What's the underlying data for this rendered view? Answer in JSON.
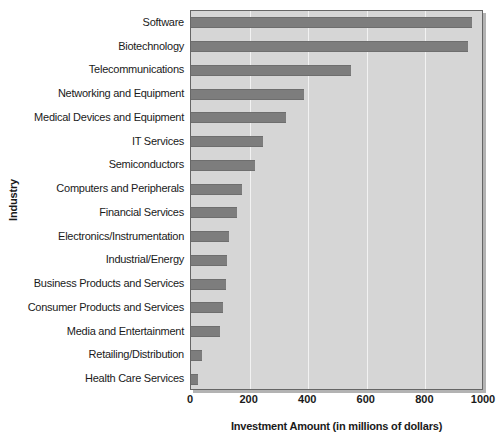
{
  "chart_data": {
    "type": "bar",
    "orientation": "horizontal",
    "title": "",
    "xlabel": "Investment Amount (in millions of dollars)",
    "ylabel": "Industry",
    "xlim": [
      0,
      1000
    ],
    "xticks": [
      0,
      200,
      400,
      600,
      800,
      1000
    ],
    "xtick_labels": [
      "0",
      "200",
      "400",
      "600",
      "800",
      "1000"
    ],
    "grid": "vertical",
    "legend": "none",
    "categories": [
      "Software",
      "Biotechnology",
      "Telecommunications",
      "Networking and Equipment",
      "Medical Devices and Equipment",
      "IT Services",
      "Semiconductors",
      "Computers and Peripherals",
      "Financial Services",
      "Electronics/Instrumentation",
      "Industrial/Energy",
      "Business Products and Services",
      "Consumer Products and Services",
      "Media and Entertainment",
      "Retailing/Distribution",
      "Health Care Services"
    ],
    "values": [
      960,
      945,
      545,
      385,
      325,
      245,
      220,
      175,
      158,
      130,
      123,
      120,
      108,
      98,
      38,
      25
    ],
    "colors": {
      "bar_fill": "#7d7d7d",
      "plot_background": "#d6d6d6",
      "gridline": "#f2f2f2",
      "axis": "#666666",
      "text": "#1a1a1a",
      "page_background": "#ffffff"
    }
  }
}
